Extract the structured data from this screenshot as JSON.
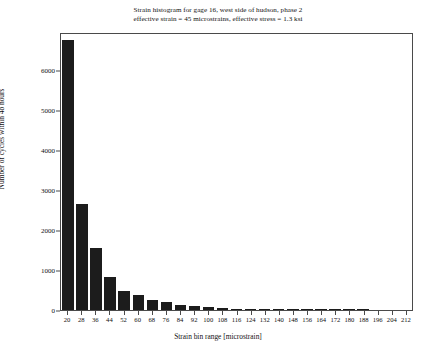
{
  "chart_data": {
    "type": "bar",
    "title": "Strain histogram for gage 16, west side of hudson, phase 2\neffective strain = 45 microstrains, effective stress = 1.3 ksi",
    "title_line1": "Strain histogram for gage 16, west side of hudson, phase 2",
    "title_line2": "effective strain = 45 microstrains, effective stress = 1.3 ksi",
    "xlabel": "Strain bin range [microstrain]",
    "ylabel": "Number of cycles within 48 hours",
    "categories": [
      20,
      28,
      36,
      44,
      52,
      60,
      68,
      76,
      84,
      92,
      100,
      108,
      116,
      124,
      132,
      140,
      148,
      156,
      164,
      172,
      180,
      188,
      196,
      204,
      212
    ],
    "values": [
      6800,
      2680,
      1560,
      830,
      480,
      390,
      250,
      190,
      120,
      95,
      70,
      55,
      38,
      25,
      16,
      10,
      6,
      4,
      3,
      2,
      1,
      1,
      0,
      0,
      0
    ],
    "ylim": [
      0,
      6950
    ],
    "xlim": [
      20,
      212
    ],
    "yticks": [
      0,
      1000,
      2000,
      3000,
      4000,
      5000,
      6000
    ],
    "ytick_labels": [
      "0",
      "1000",
      "2000",
      "3000",
      "4000",
      "5000",
      "6000"
    ],
    "xtick_labels": [
      "20",
      "28",
      "36",
      "44",
      "52",
      "60",
      "68",
      "76",
      "84",
      "92",
      "100",
      "108",
      "116",
      "124",
      "132",
      "140",
      "148",
      "156",
      "164",
      "172",
      "180",
      "188",
      "196",
      "204",
      "212"
    ],
    "grid": false,
    "legend": null,
    "bar_color": "#1c1c1c",
    "axis_color": "#4a4a4a",
    "background": "#ffffff"
  }
}
